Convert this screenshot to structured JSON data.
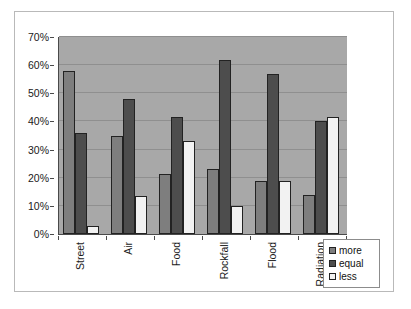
{
  "chart_data": {
    "type": "bar",
    "title": "",
    "xlabel": "",
    "ylabel": "",
    "ylim": [
      0,
      70
    ],
    "ytick_labels": [
      "0%",
      "10%",
      "20%",
      "30%",
      "40%",
      "50%",
      "60%",
      "70%"
    ],
    "ytick_values": [
      0,
      10,
      20,
      30,
      40,
      50,
      60,
      70
    ],
    "grid": true,
    "legend_position": "bottom-right",
    "categories": [
      "Street",
      "Air",
      "Food",
      "Rockfall",
      "Flood",
      "Radiation"
    ],
    "series": [
      {
        "name": "more",
        "color": "#7e7e7e",
        "values": [
          58,
          35,
          21.5,
          23,
          19,
          14
        ]
      },
      {
        "name": "equal",
        "color": "#4d4d4d",
        "values": [
          36,
          48,
          41.5,
          62,
          57,
          40
        ]
      },
      {
        "name": "less",
        "color": "#f2f2f2",
        "values": [
          3,
          13.5,
          33,
          10,
          19,
          41.5
        ]
      }
    ]
  },
  "legend": {
    "items": [
      {
        "label": "more",
        "swatch": "more-swatch-icon"
      },
      {
        "label": "equal",
        "swatch": "equal-swatch-icon"
      },
      {
        "label": "less",
        "swatch": "less-swatch-icon"
      }
    ]
  },
  "colors": {
    "plot_background": "#a8a8a8",
    "gridline": "#8f8f8f",
    "axis": "#4a4a4a",
    "frame_border": "#b9b9b9",
    "bar_outline": "#222222",
    "page_background": "#ffffff"
  }
}
